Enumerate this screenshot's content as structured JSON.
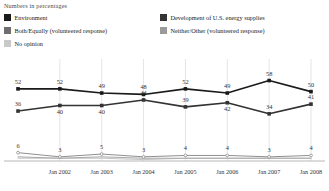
{
  "subtitle": "Numbers in percentages",
  "legend": {
    "items": [
      {
        "label": "Environment",
        "color": "#1a1a1a"
      },
      {
        "label": "Development of U.S. energy supplies",
        "color": "#333333"
      },
      {
        "label": "Both/Equally (volunteered response)",
        "color": "#6e6e6e"
      },
      {
        "label": "Neither/Other (volunteered response)",
        "color": "#9a9a9a"
      },
      {
        "label": "No opinion",
        "color": "#c9c9c9"
      }
    ]
  },
  "chart_data": {
    "type": "line",
    "title": "",
    "subtitle": "Numbers in percentages",
    "xlabel": "",
    "ylabel": "",
    "ylim": [
      0,
      62
    ],
    "grid": "vertical",
    "legend_position": "top",
    "x": [
      "",
      "Jan 2002",
      "Jan 2003",
      "Jan 2004",
      "Jan 2005",
      "Jan 2006",
      "Jan 2007",
      "Jan 2008"
    ],
    "tick_labels": [
      "Jan 2002",
      "Jan 2003",
      "Jan 2004",
      "Jan 2005",
      "Jan 2006",
      "Jan 2007",
      "Jan 2008"
    ],
    "series": [
      {
        "name": "Environment",
        "color": "#1a1a1a",
        "values": [
          52,
          52,
          49,
          48,
          52,
          49,
          58,
          50
        ]
      },
      {
        "name": "Development of U.S. energy supplies",
        "color": "#333333",
        "values": [
          36,
          40,
          40,
          44,
          39,
          42,
          34,
          41
        ]
      },
      {
        "name": "Both/Equally (volunteered response)",
        "color": "#8f8f8f",
        "values": [
          6,
          3,
          5,
          3,
          4,
          4,
          3,
          4
        ]
      },
      {
        "name": "Neither/Other (volunteered response)",
        "color": "#a8a8a8",
        "values": [
          3,
          2,
          3,
          2,
          2,
          2,
          2,
          2
        ]
      },
      {
        "name": "No opinion",
        "color": "#c4c4c4",
        "values": [
          2,
          2,
          2,
          1,
          2,
          2,
          2,
          2
        ]
      }
    ],
    "labeled_series": [
      "Environment",
      "Development of U.S. energy supplies",
      "Both/Equally (volunteered response)"
    ],
    "axis_line_color": "#b8b8b8",
    "gridline_color": "#d8d8d8"
  }
}
